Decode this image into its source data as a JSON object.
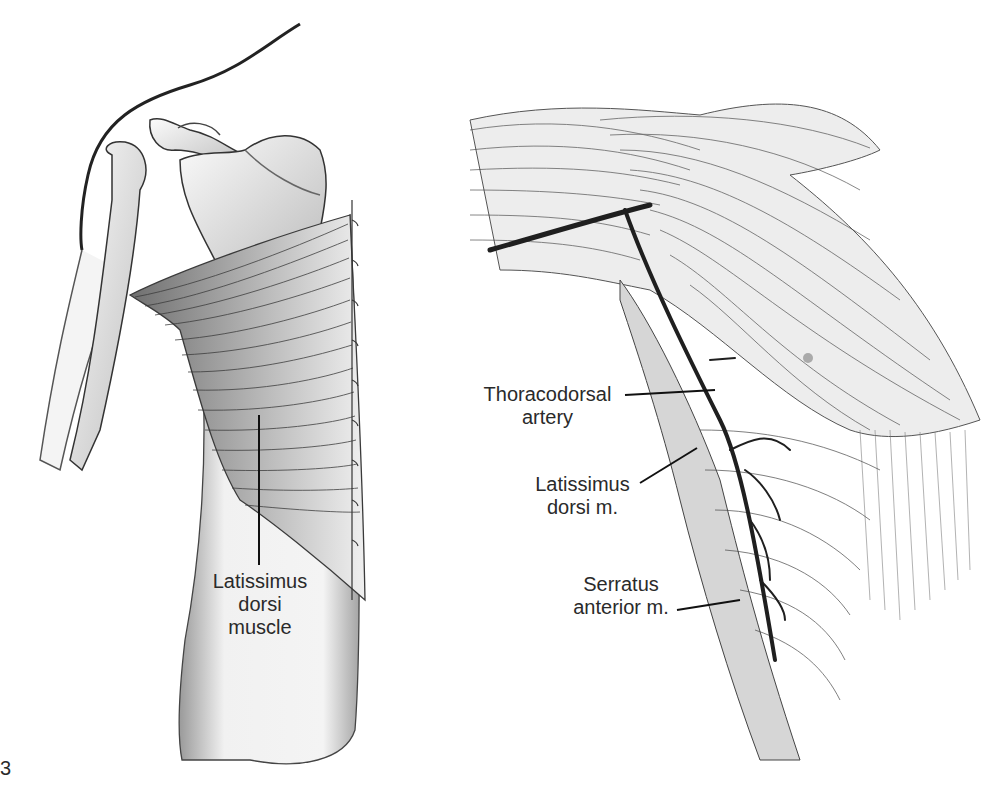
{
  "figure": {
    "panel_marker": "3",
    "left_panel": {
      "subject": "Posterior view of shoulder and back",
      "labels": [
        {
          "id": "latissimus-dorsi-muscle",
          "lines": [
            "Latissimus",
            "dorsi",
            "muscle"
          ]
        }
      ]
    },
    "right_panel": {
      "subject": "Lateral view of axilla and chest wall",
      "labels": [
        {
          "id": "thoracodorsal-artery",
          "lines": [
            "Thoracodorsal",
            "artery"
          ]
        },
        {
          "id": "latissimus-dorsi-m",
          "lines": [
            "Latissimus",
            "dorsi m."
          ]
        },
        {
          "id": "serratus-anterior-m",
          "lines": [
            "Serratus",
            "anterior m."
          ]
        }
      ]
    },
    "colors": {
      "ink": "#231f20",
      "shade": "#8a8a8a",
      "light_shade": "#d4d4d4",
      "background": "#ffffff"
    }
  }
}
